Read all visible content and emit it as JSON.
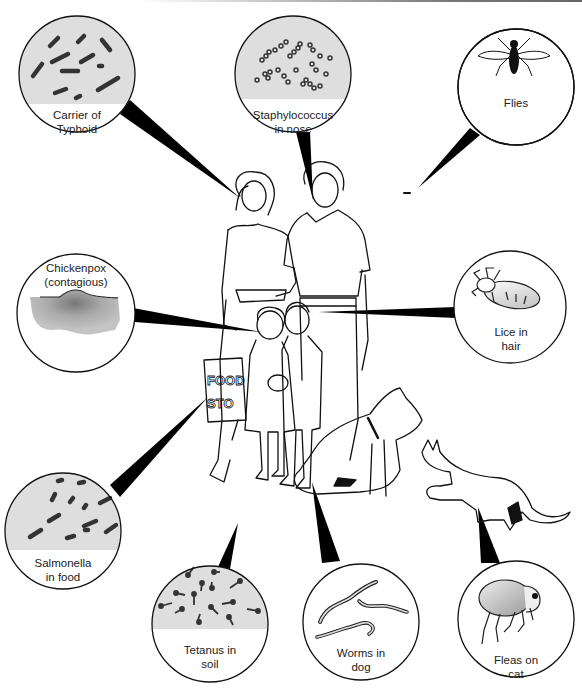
{
  "diagram": {
    "title": "",
    "colors": {
      "outline": "#111111",
      "specimen_fill": "#dedede",
      "pointer": "#000000",
      "background": "#ffffff"
    },
    "callouts": [
      {
        "id": "typhoid",
        "line1": "Carrier of",
        "line2": "Typhoid",
        "icon": "rod-bacteria-icon",
        "points_to": "woman"
      },
      {
        "id": "staph",
        "line1": "Staphylococcus",
        "line2": "in nose",
        "icon": "cocci-cluster-icon",
        "points_to": "man-nose"
      },
      {
        "id": "flies",
        "line1": "Flies",
        "line2": "",
        "icon": "fly-icon",
        "points_to": "small-fly"
      },
      {
        "id": "chickenpox",
        "line1": "Chickenpox",
        "line2": "(contagious)",
        "icon": "skin-lesion-icon",
        "points_to": "girl"
      },
      {
        "id": "lice",
        "line1": "Lice in",
        "line2": "hair",
        "icon": "louse-icon",
        "points_to": "boy-hair"
      },
      {
        "id": "salmonella",
        "line1": "Salmonella",
        "line2": "in food",
        "icon": "rod-bacteria-icon",
        "points_to": "food-bag"
      },
      {
        "id": "tetanus",
        "line1": "Tetanus in",
        "line2": "soil",
        "icon": "spore-rod-icon",
        "points_to": "ground"
      },
      {
        "id": "worms",
        "line1": "Worms in",
        "line2": "dog",
        "icon": "worm-icon",
        "points_to": "dog"
      },
      {
        "id": "fleas",
        "line1": "Fleas on",
        "line2": "cat",
        "icon": "flea-icon",
        "points_to": "cat"
      }
    ],
    "scene": {
      "figures": [
        "woman",
        "man",
        "girl",
        "boy",
        "dog",
        "cat"
      ],
      "bag_text_line1": "FOOD",
      "bag_text_line2": "STO"
    }
  }
}
